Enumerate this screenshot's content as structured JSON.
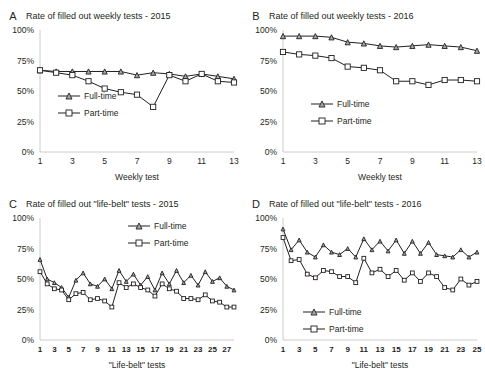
{
  "figure": {
    "panels": [
      "A",
      "B",
      "C",
      "D"
    ],
    "legend_labels": {
      "full_time": "Full-time",
      "part_time": "Part-time"
    },
    "colors": {
      "line": "#231f20",
      "axis": "#bfbfbf",
      "marker_full_time": "#a6a6a6",
      "marker_part_time": "#ffffff"
    }
  },
  "chart_data": [
    {
      "panel": "A",
      "type": "line",
      "title": "Rate of filled out weekly tests - 2015",
      "xlabel": "Weekly test",
      "ylabel": "",
      "ylim": [
        0,
        100
      ],
      "yticks": [
        0,
        25,
        50,
        75,
        100
      ],
      "yticklabels": [
        "0%",
        "25%",
        "50%",
        "75%",
        "100%"
      ],
      "x": [
        1,
        2,
        3,
        4,
        5,
        6,
        7,
        8,
        9,
        10,
        11,
        12,
        13
      ],
      "xticklabels": [
        "1",
        "3",
        "5",
        "7",
        "9",
        "11",
        "13"
      ],
      "xticks": [
        1,
        3,
        5,
        7,
        9,
        11,
        13
      ],
      "grid": false,
      "legend_position": "center-left",
      "series": [
        {
          "name": "Full-time",
          "values": [
            67,
            66,
            66,
            66,
            66,
            66,
            63,
            65,
            64,
            62,
            64,
            62,
            60
          ]
        },
        {
          "name": "Part-time",
          "values": [
            67,
            65,
            63,
            58,
            52,
            49,
            47,
            37,
            63,
            58,
            64,
            58,
            57
          ]
        }
      ]
    },
    {
      "panel": "B",
      "type": "line",
      "title": "Rate of filled out weekly tests - 2016",
      "xlabel": "Weekly test",
      "ylabel": "",
      "ylim": [
        0,
        100
      ],
      "yticks": [
        0,
        25,
        50,
        75,
        100
      ],
      "yticklabels": [
        "0%",
        "25%",
        "50%",
        "75%",
        "100%"
      ],
      "x": [
        1,
        2,
        3,
        4,
        5,
        6,
        7,
        8,
        9,
        10,
        11,
        12,
        13
      ],
      "xticklabels": [
        "1",
        "3",
        "5",
        "7",
        "9",
        "11",
        "13"
      ],
      "xticks": [
        1,
        3,
        5,
        7,
        9,
        11,
        13
      ],
      "grid": false,
      "legend_position": "center-left",
      "series": [
        {
          "name": "Full-time",
          "values": [
            95,
            95,
            95,
            94,
            90,
            89,
            87,
            86,
            87,
            88,
            87,
            86,
            83
          ]
        },
        {
          "name": "Part-time",
          "values": [
            82,
            80,
            79,
            77,
            70,
            69,
            67,
            58,
            58,
            55,
            59,
            59,
            58
          ]
        }
      ]
    },
    {
      "panel": "C",
      "type": "line",
      "title": "Rate of filled out \"life-belt\" tests - 2015",
      "xlabel": "\"Life-belt\" tests",
      "ylabel": "",
      "ylim": [
        0,
        100
      ],
      "yticks": [
        0,
        25,
        50,
        75,
        100
      ],
      "yticklabels": [
        "0%",
        "25%",
        "50%",
        "75%",
        "100%"
      ],
      "x": [
        1,
        2,
        3,
        4,
        5,
        6,
        7,
        8,
        9,
        10,
        11,
        12,
        13,
        14,
        15,
        16,
        17,
        18,
        19,
        20,
        21,
        22,
        23,
        24,
        25,
        26,
        27,
        28
      ],
      "xticklabels": [
        "1",
        "3",
        "5",
        "7",
        "9",
        "11",
        "13",
        "15",
        "17",
        "19",
        "21",
        "23",
        "25",
        "27"
      ],
      "xticks": [
        1,
        3,
        5,
        7,
        9,
        11,
        13,
        15,
        17,
        19,
        21,
        23,
        25,
        27
      ],
      "grid": false,
      "legend_position": "top-right",
      "series": [
        {
          "name": "Full-time",
          "values": [
            66,
            50,
            47,
            43,
            35,
            49,
            55,
            46,
            44,
            50,
            42,
            57,
            48,
            54,
            45,
            52,
            41,
            55,
            46,
            57,
            47,
            53,
            45,
            56,
            48,
            51,
            44,
            41
          ]
        },
        {
          "name": "Part-time",
          "values": [
            56,
            46,
            42,
            41,
            33,
            38,
            39,
            33,
            34,
            32,
            27,
            47,
            43,
            46,
            43,
            41,
            36,
            46,
            42,
            40,
            34,
            34,
            33,
            37,
            32,
            31,
            27,
            27
          ]
        }
      ]
    },
    {
      "panel": "D",
      "type": "line",
      "title": "Rate of filled out \"life-belt\" tests - 2016",
      "xlabel": "\"Life-belt\" tests",
      "ylabel": "",
      "ylim": [
        0,
        100
      ],
      "yticks": [
        0,
        25,
        50,
        75,
        100
      ],
      "yticklabels": [
        "0%",
        "25%",
        "50%",
        "75%",
        "100%"
      ],
      "x": [
        1,
        2,
        3,
        4,
        5,
        6,
        7,
        8,
        9,
        10,
        11,
        12,
        13,
        14,
        15,
        16,
        17,
        18,
        19,
        20,
        21,
        22,
        23,
        24,
        25
      ],
      "xticklabels": [
        "1",
        "3",
        "5",
        "7",
        "9",
        "11",
        "13",
        "15",
        "17",
        "19",
        "21",
        "23",
        "25",
        "27"
      ],
      "xticks": [
        1,
        3,
        5,
        7,
        9,
        11,
        13,
        15,
        17,
        19,
        21,
        23,
        25,
        27
      ],
      "grid": false,
      "legend_position": "center-left",
      "series": [
        {
          "name": "Full-time",
          "values": [
            91,
            74,
            82,
            72,
            68,
            78,
            72,
            70,
            75,
            68,
            83,
            74,
            81,
            73,
            82,
            71,
            81,
            71,
            80,
            70,
            69,
            68,
            74,
            68,
            72
          ]
        },
        {
          "name": "Part-time",
          "values": [
            84,
            65,
            66,
            54,
            51,
            57,
            56,
            52,
            52,
            47,
            67,
            55,
            58,
            52,
            57,
            49,
            55,
            48,
            55,
            52,
            43,
            41,
            50,
            45,
            48
          ]
        }
      ]
    }
  ]
}
